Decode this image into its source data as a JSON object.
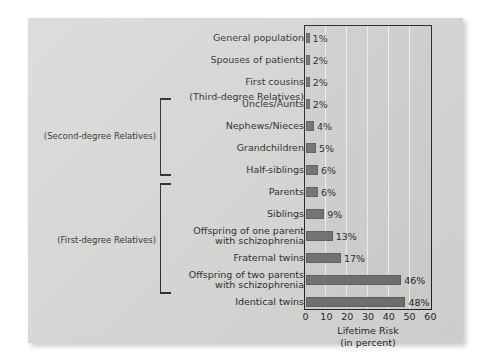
{
  "chart_data": {
    "type": "bar",
    "orientation": "horizontal",
    "title": "",
    "xlabel": "Lifetime Risk\n(in percent)",
    "xlabel_line1": "Lifetime Risk",
    "xlabel_line2": "(in percent)",
    "ylabel": "",
    "xlim": [
      0,
      60
    ],
    "xticks": [
      0,
      10,
      20,
      30,
      40,
      50,
      60
    ],
    "xtick_labels": [
      "0",
      "10",
      "20",
      "30",
      "40",
      "50",
      "60"
    ],
    "grid": "vertical-white-gridlines",
    "legend": "none",
    "bar_color": "#6d6d6d",
    "plot_background": "#cfcfcd",
    "card_background": "#d5d5d3",
    "categories": [
      "General population",
      "Spouses of patients",
      "First cousins",
      "Uncles/Aunts",
      "Nephews/Nieces",
      "Grandchildren",
      "Half-siblings",
      "Parents",
      "Siblings",
      "Offspring of one parent with schizophrenia",
      "Fraternal twins",
      "Offspring of two parents with schizophrenia",
      "Identical twins"
    ],
    "values": [
      1,
      2,
      2,
      2,
      4,
      5,
      6,
      6,
      9,
      13,
      17,
      46,
      48
    ],
    "data_labels": [
      "1%",
      "2%",
      "2%",
      "2%",
      "4%",
      "5%",
      "6%",
      "6%",
      "9%",
      "13%",
      "17%",
      "46%",
      "48%"
    ]
  },
  "rows": [
    {
      "label_line1": "General population",
      "label_line2": "",
      "value": 1,
      "data_label": "1%"
    },
    {
      "label_line1": "Spouses of patients",
      "label_line2": "",
      "value": 2,
      "data_label": "2%"
    },
    {
      "label_line1": "First cousins",
      "label_line2": "",
      "value": 2,
      "data_label": "2%"
    },
    {
      "label_line1": "Uncles/Aunts",
      "label_line2": "",
      "value": 2,
      "data_label": "2%"
    },
    {
      "label_line1": "Nephews/Nieces",
      "label_line2": "",
      "value": 4,
      "data_label": "4%"
    },
    {
      "label_line1": "Grandchildren",
      "label_line2": "",
      "value": 5,
      "data_label": "5%"
    },
    {
      "label_line1": "Half-siblings",
      "label_line2": "",
      "value": 6,
      "data_label": "6%"
    },
    {
      "label_line1": "Parents",
      "label_line2": "",
      "value": 6,
      "data_label": "6%"
    },
    {
      "label_line1": "Siblings",
      "label_line2": "",
      "value": 9,
      "data_label": "9%"
    },
    {
      "label_line1": "Offspring of one parent",
      "label_line2": "with schizophrenia",
      "value": 13,
      "data_label": "13%"
    },
    {
      "label_line1": "Fraternal twins",
      "label_line2": "",
      "value": 17,
      "data_label": "17%"
    },
    {
      "label_line1": "Offspring of two parents",
      "label_line2": "with schizophrenia",
      "value": 46,
      "data_label": "46%"
    },
    {
      "label_line1": "Identical twins",
      "label_line2": "",
      "value": 48,
      "data_label": "48%"
    }
  ],
  "annotations": {
    "third_degree_note": "(Third-degree Relatives)",
    "second_degree_group": "(Second-degree Relatives)",
    "first_degree_group": "(First-degree Relatives)"
  },
  "axis": {
    "ticks": [
      "0",
      "10",
      "20",
      "30",
      "40",
      "50",
      "60"
    ],
    "title_line1": "Lifetime Risk",
    "title_line2": "(in percent)"
  }
}
